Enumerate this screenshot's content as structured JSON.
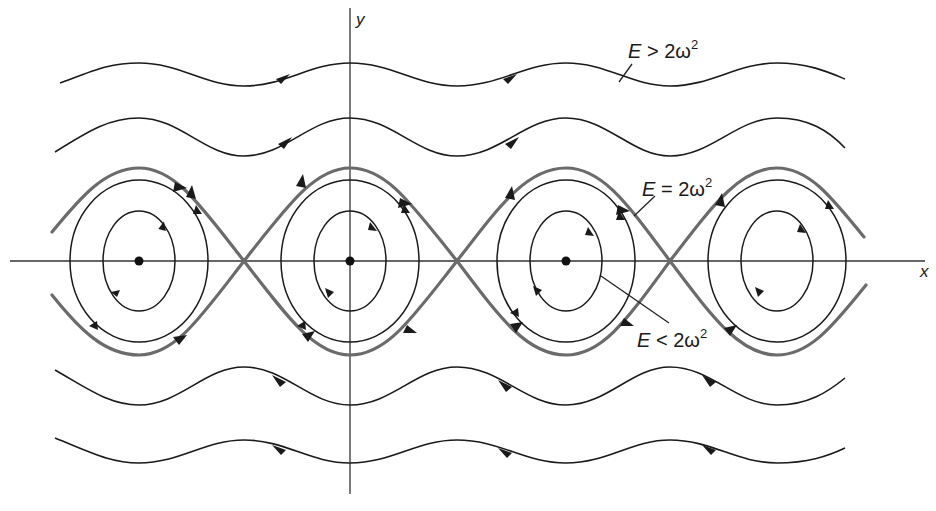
{
  "figure": {
    "type": "phase_portrait",
    "axes": {
      "x_label": "x",
      "y_label": "y"
    },
    "labels": {
      "open_orbits": {
        "E": "E",
        "rel": ">",
        "rhs": "2ω",
        "exp": "2"
      },
      "separatrix": {
        "E": "E",
        "rel": "=",
        "rhs": "2ω",
        "exp": "2"
      },
      "closed_orbits": {
        "E": "E",
        "rel": "<",
        "rhs": "2ω",
        "exp": "2"
      }
    },
    "colors": {
      "trajectory": "#1a1a1a",
      "separatrix": "#6b6b6b",
      "axis": "#333333",
      "background": "#ffffff"
    },
    "centers_x": [
      139,
      350,
      566,
      777
    ],
    "center_dots_shown": [
      true,
      true,
      true,
      false
    ],
    "saddles_x": [
      244,
      457,
      670
    ],
    "axis_y": 261,
    "y_axis_x": 350
  },
  "caption": {
    "text_visible": "(caption text cut off at bottom edge — not legible)"
  }
}
